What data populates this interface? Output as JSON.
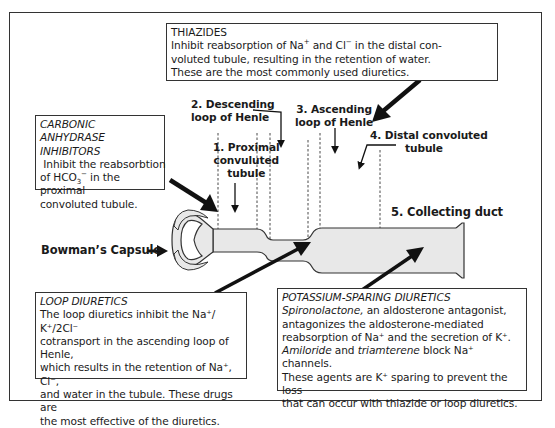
{
  "diagram": {
    "labels": {
      "proximal": [
        "1. Proximal",
        "convuluted",
        "tubule"
      ],
      "descending": [
        "2. Descending",
        "loop of Henle"
      ],
      "ascending": [
        "3. Ascending",
        "loop of Henle"
      ],
      "distal": [
        "4. Distal convoluted",
        "tubule"
      ],
      "collecting": "5. Collecting duct",
      "bowman": "Bowman’s Capsule"
    },
    "colors": {
      "tubule_fill": "#e8e8e8",
      "outline": "#333333",
      "arrow": "#111111"
    }
  },
  "boxes": {
    "thiazides": {
      "title": "THIAZIDES",
      "line1_pre": "Inhibit reabsorption of Na",
      "line1_sup1": "+",
      "line1_mid": " and Cl",
      "line1_sup2": "−",
      "line1_post": " in the distal con-",
      "line2": "voluted tubule, resulting in the retention of water.",
      "line3": "These are the most commonly used diuretics."
    },
    "carbonic": {
      "title1": "CARBONIC ANHYDRASE",
      "title2": "INHIBITORS",
      "line1": " Inhibit the reabsorbtion",
      "line2_pre": "of HCO",
      "line2_sub": "3",
      "line2_sup": "−",
      "line2_post": " in the proximal",
      "line3": "convoluted tubule."
    },
    "loop": {
      "title": "LOOP DIURETICS",
      "line1": "The loop diuretics inhibit the Na⁺/ K⁺/2Cl⁻",
      "line2": "cotransport in the ascending loop of Henle,",
      "line3": "which results in the retention of Na⁺, Cl⁻,",
      "line4": "and water in the tubule. These drugs are",
      "line5": "the most effective of the diuretics."
    },
    "ksparing": {
      "title": "POTASSIUM-SPARING DIURETICS",
      "line1_it": "Spironolactone,",
      "line1_post": " an aldosterone antagonist,",
      "line2": "antagonizes the aldosterone-mediated",
      "line3": "reabsorption of Na⁺ and the secretion of K⁺.",
      "line4_it1": "Amiloride",
      "line4_mid": " and ",
      "line4_it2": "triamterene",
      "line4_post": " block Na⁺ channels.",
      "line5": "These agents are K⁺ sparing to prevent the loss",
      "line6": "that can occur with thiazide or loop diuretics."
    }
  }
}
